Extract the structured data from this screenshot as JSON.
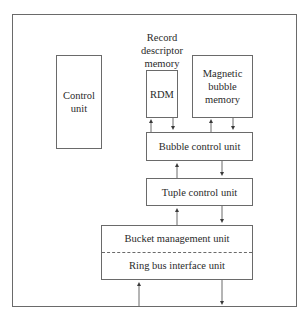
{
  "diagram": {
    "control_unit": {
      "label": "Control\nunit"
    },
    "rdm_caption": "Record\ndescriptor\nmemory",
    "rdm": {
      "label": "RDM"
    },
    "magnetic_bubble_memory": {
      "label": "Magnetic\nbubble\nmemory"
    },
    "bubble_control_unit": {
      "label": "Bubble control unit"
    },
    "tuple_control_unit": {
      "label": "Tuple control unit"
    },
    "bucket_management_unit": {
      "label": "Bucket management unit"
    },
    "ring_bus_interface_unit": {
      "label": "Ring bus interface unit"
    },
    "colors": {
      "line": "#6a6a6a",
      "text": "#2a2a2a",
      "background": "#ffffff"
    }
  }
}
